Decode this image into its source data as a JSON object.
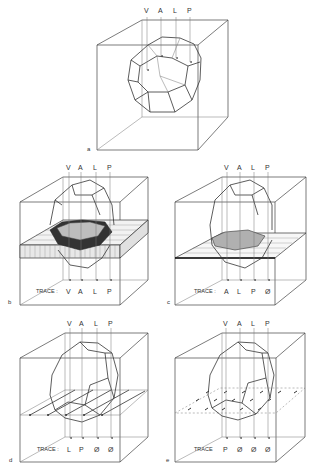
{
  "figure": {
    "panels": [
      {
        "id": "a",
        "label": "a",
        "probe_labels": [
          "V",
          "A",
          "L",
          "P"
        ],
        "has_plane": false,
        "trace_label": "",
        "trace": []
      },
      {
        "id": "b",
        "label": "b",
        "probe_labels": [
          "V",
          "A",
          "L",
          "P"
        ],
        "has_plane": true,
        "plane_type": "thick-slab",
        "trace_label": "TRACE :",
        "trace": [
          "V",
          "A",
          "L",
          "P"
        ]
      },
      {
        "id": "c",
        "label": "c",
        "probe_labels": [
          "V",
          "A",
          "L",
          "P"
        ],
        "has_plane": true,
        "plane_type": "thin-plane",
        "trace_label": "TRACE :",
        "trace": [
          "A",
          "L",
          "P",
          "Ø"
        ]
      },
      {
        "id": "d",
        "label": "d",
        "probe_labels": [
          "V",
          "A",
          "L",
          "P"
        ],
        "has_plane": true,
        "plane_type": "vector-field-lines",
        "trace_label": "TRACE :",
        "trace": [
          "L",
          "P",
          "Ø",
          "Ø"
        ]
      },
      {
        "id": "e",
        "label": "e",
        "probe_labels": [
          "V",
          "A",
          "L",
          "P"
        ],
        "has_plane": true,
        "plane_type": "vector-field-dots",
        "trace_label": "TRACE",
        "trace": [
          "P",
          "Ø",
          "Ø",
          "Ø"
        ]
      }
    ]
  }
}
